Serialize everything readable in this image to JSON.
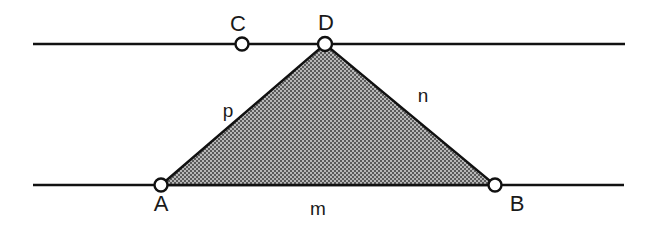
{
  "figure": {
    "background_color": "#ffffff",
    "stroke_color": "#111111",
    "fill_color": "#8a8a8a",
    "fill_pattern": "checkered-dither-50",
    "width": 660,
    "height": 225
  },
  "lines": [
    {
      "name": "upper-parallel-line",
      "x1": 33,
      "y1": 44,
      "x2": 625,
      "y2": 44
    },
    {
      "name": "lower-parallel-line",
      "x1": 33,
      "y1": 185,
      "x2": 624,
      "y2": 185
    }
  ],
  "points": [
    {
      "id": "A",
      "label": "A",
      "cx": 161,
      "cy": 185,
      "r": 6.5,
      "label_x": 161,
      "label_y": 211,
      "on_line": "lower-parallel-line"
    },
    {
      "id": "B",
      "label": "B",
      "cx": 495,
      "cy": 185,
      "r": 6.5,
      "label_x": 517,
      "label_y": 211,
      "on_line": "lower-parallel-line"
    },
    {
      "id": "C",
      "label": "C",
      "cx": 242,
      "cy": 44,
      "r": 6.5,
      "label_x": 238,
      "label_y": 31,
      "on_line": "upper-parallel-line"
    },
    {
      "id": "D",
      "label": "D",
      "cx": 325,
      "cy": 44,
      "r": 7.0,
      "label_x": 326,
      "label_y": 30,
      "on_line": "upper-parallel-line"
    }
  ],
  "triangle": {
    "name": "triangle-ADB",
    "vertices": "161,185 325,44 495,185",
    "shaded": true
  },
  "segment_labels": [
    {
      "id": "p",
      "label": "p",
      "x": 228,
      "y": 117,
      "describes": "side A to D"
    },
    {
      "id": "n",
      "label": "n",
      "x": 423,
      "y": 102,
      "describes": "side D to B"
    },
    {
      "id": "m",
      "label": "m",
      "x": 318,
      "y": 215,
      "describes": "side A to B"
    }
  ]
}
